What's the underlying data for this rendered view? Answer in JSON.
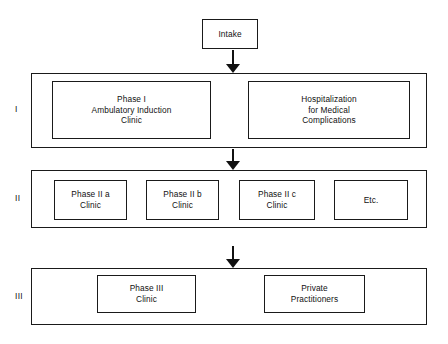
{
  "diagram": {
    "colors": {
      "stroke": "#1a1a1a",
      "text": "#111111",
      "background": "#ffffff",
      "arrow": "#111111"
    },
    "entry": {
      "label": "Intake"
    },
    "tiers": [
      {
        "numeral": "I",
        "boxes": [
          {
            "label": "Phase I\nAmbulatory Induction\nClinic"
          },
          {
            "label": "Hospitalization\nfor Medical\nComplications"
          }
        ]
      },
      {
        "numeral": "II",
        "boxes": [
          {
            "label": "Phase II a\nClinic"
          },
          {
            "label": "Phase II b\nClinic"
          },
          {
            "label": "Phase II c\nClinic"
          },
          {
            "label": "Etc."
          }
        ]
      },
      {
        "numeral": "III",
        "boxes": [
          {
            "label": "Phase III\nClinic"
          },
          {
            "label": "Private\nPractitioners"
          }
        ]
      }
    ],
    "arrows": [
      {
        "name": "intake-to-tier1",
        "direction": "down"
      },
      {
        "name": "tier1-to-tier2",
        "direction": "down"
      },
      {
        "name": "tier2-to-tier3",
        "direction": "down"
      }
    ]
  }
}
